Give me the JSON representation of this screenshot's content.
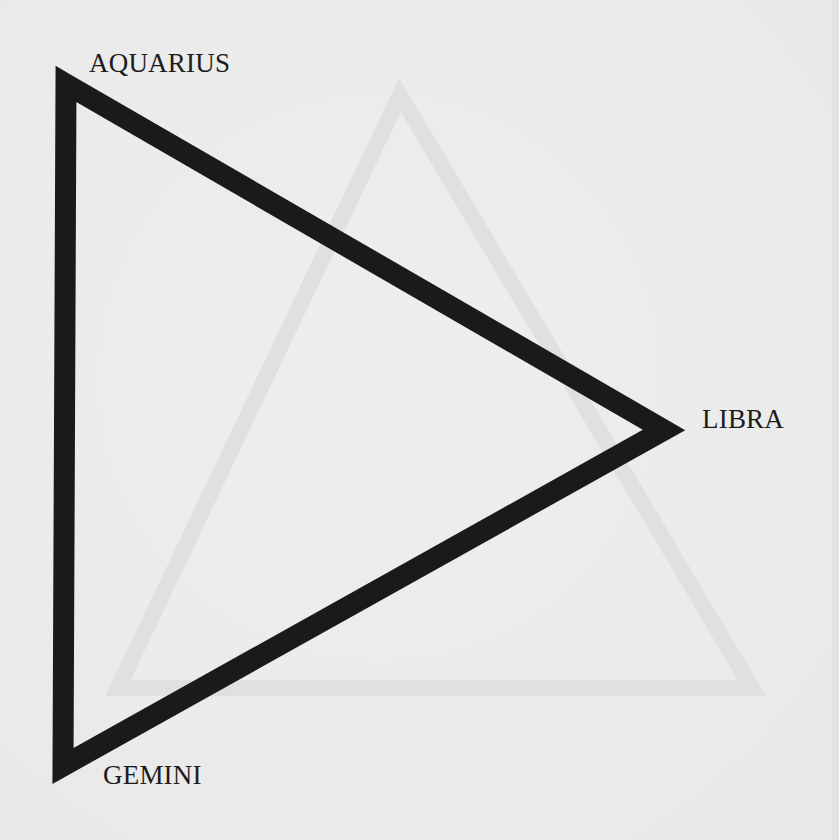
{
  "diagram": {
    "type": "triangle",
    "vertices": [
      {
        "label": "AQUARIUS",
        "position": "top-left"
      },
      {
        "label": "LIBRA",
        "position": "right"
      },
      {
        "label": "GEMINI",
        "position": "bottom-left"
      }
    ],
    "colors": {
      "paper": "#ebebeb",
      "stroke": "#1a1a1a",
      "text": "#1c1c1c",
      "bleed_through": "#e2e2e2"
    }
  },
  "labels": {
    "aquarius": "AQUARIUS",
    "libra": "LIBRA",
    "gemini": "GEMINI"
  }
}
